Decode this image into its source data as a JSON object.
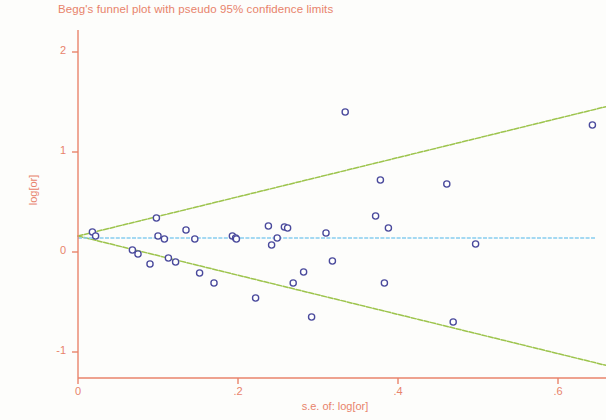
{
  "chart_data": {
    "type": "scatter",
    "title": "Begg's funnel plot with pseudo 95% confidence limits",
    "xlabel": "s.e. of: log[or]",
    "ylabel": "log[or]",
    "xlim": [
      0,
      0.66
    ],
    "ylim": [
      -1.2,
      2.15
    ],
    "xticks": [
      0,
      0.2,
      0.4,
      0.6
    ],
    "xtick_labels": [
      "0",
      ".2",
      ".4",
      ".6"
    ],
    "yticks": [
      -1,
      0,
      1,
      2
    ],
    "ytick_labels": [
      "-1",
      "0",
      "1",
      "2"
    ],
    "grid": false,
    "legend": "none",
    "colors": {
      "axis": "#e8836b",
      "title": "#e8836b",
      "point_stroke": "#4a4a9c",
      "point_fill": "#ffffff",
      "ci_line": "#9dc44d",
      "pooled_line": "#87cdf0",
      "background": "#fdfdfb"
    },
    "pooled_effect": 0.14,
    "funnel_apex": {
      "se": 0.0,
      "log_or": 0.16
    },
    "ci_slope": 1.96,
    "series": [
      {
        "name": "studies",
        "marker": "open-circle",
        "points": [
          {
            "se": 0.018,
            "log_or": 0.2
          },
          {
            "se": 0.022,
            "log_or": 0.16
          },
          {
            "se": 0.068,
            "log_or": 0.02
          },
          {
            "se": 0.075,
            "log_or": -0.02
          },
          {
            "se": 0.09,
            "log_or": -0.12
          },
          {
            "se": 0.098,
            "log_or": 0.34
          },
          {
            "se": 0.1,
            "log_or": 0.16
          },
          {
            "se": 0.108,
            "log_or": 0.13
          },
          {
            "se": 0.113,
            "log_or": -0.06
          },
          {
            "se": 0.122,
            "log_or": -0.1
          },
          {
            "se": 0.135,
            "log_or": 0.22
          },
          {
            "se": 0.146,
            "log_or": 0.13
          },
          {
            "se": 0.152,
            "log_or": -0.21
          },
          {
            "se": 0.17,
            "log_or": -0.31
          },
          {
            "se": 0.193,
            "log_or": 0.16
          },
          {
            "se": 0.197,
            "log_or": 0.14
          },
          {
            "se": 0.198,
            "log_or": 0.13
          },
          {
            "se": 0.222,
            "log_or": -0.46
          },
          {
            "se": 0.238,
            "log_or": 0.26
          },
          {
            "se": 0.242,
            "log_or": 0.07
          },
          {
            "se": 0.249,
            "log_or": 0.14
          },
          {
            "se": 0.258,
            "log_or": 0.25
          },
          {
            "se": 0.262,
            "log_or": 0.24
          },
          {
            "se": 0.269,
            "log_or": -0.31
          },
          {
            "se": 0.282,
            "log_or": -0.2
          },
          {
            "se": 0.292,
            "log_or": -0.65
          },
          {
            "se": 0.31,
            "log_or": 0.19
          },
          {
            "se": 0.318,
            "log_or": -0.09
          },
          {
            "se": 0.334,
            "log_or": 1.4
          },
          {
            "se": 0.372,
            "log_or": 0.36
          },
          {
            "se": 0.378,
            "log_or": 0.72
          },
          {
            "se": 0.383,
            "log_or": -0.31
          },
          {
            "se": 0.388,
            "log_or": 0.24
          },
          {
            "se": 0.461,
            "log_or": 0.68
          },
          {
            "se": 0.469,
            "log_or": -0.7
          },
          {
            "se": 0.497,
            "log_or": 0.08
          },
          {
            "se": 0.643,
            "log_or": 1.27
          }
        ]
      }
    ]
  }
}
